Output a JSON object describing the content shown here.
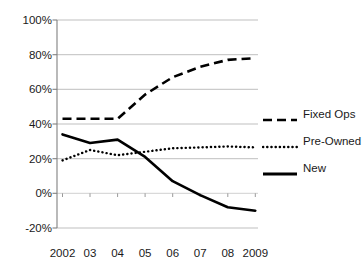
{
  "chart_data": {
    "type": "line",
    "title": "",
    "subtitle": "",
    "xlabel": "",
    "ylabel": "",
    "x": [
      2002,
      2003,
      2004,
      2005,
      2006,
      2007,
      2008,
      2009
    ],
    "categories": [
      "2002",
      "03",
      "04",
      "05",
      "06",
      "07",
      "08",
      "2009"
    ],
    "ylim": [
      -20,
      100
    ],
    "ytick_values": [
      100,
      80,
      60,
      40,
      20,
      0,
      -20
    ],
    "ytick_labels": [
      "100%",
      "80%",
      "60%",
      "40%",
      "20%",
      "0%",
      "-20%"
    ],
    "grid": "horizontal",
    "legend_position": "right",
    "series": [
      {
        "name": "Fixed Ops",
        "style": "dashed",
        "color": "#000000",
        "values": [
          43,
          43,
          43,
          57,
          67,
          73,
          77,
          78
        ]
      },
      {
        "name": "Pre-Owned",
        "style": "dotted",
        "color": "#000000",
        "values": [
          19,
          25,
          22,
          24,
          26,
          26.5,
          27,
          26.5
        ]
      },
      {
        "name": "New",
        "style": "solid",
        "color": "#000000",
        "values": [
          34,
          29,
          31,
          21,
          7,
          -1,
          -8,
          -10
        ]
      }
    ]
  },
  "axis": {
    "ytick_labels": [
      "100%",
      "80%",
      "60%",
      "40%",
      "20%",
      "0%",
      "-20%"
    ],
    "xtick_labels": [
      "2002",
      "03",
      "04",
      "05",
      "06",
      "07",
      "08",
      "2009"
    ]
  },
  "legend": {
    "items": [
      {
        "label": "Fixed Ops"
      },
      {
        "label": "Pre-Owned"
      },
      {
        "label": "New"
      }
    ]
  },
  "colors": {
    "series": "#000000",
    "grid": "#bfbfbf",
    "axis": "#808080",
    "text": "#1a1a1a",
    "background": "#ffffff"
  }
}
